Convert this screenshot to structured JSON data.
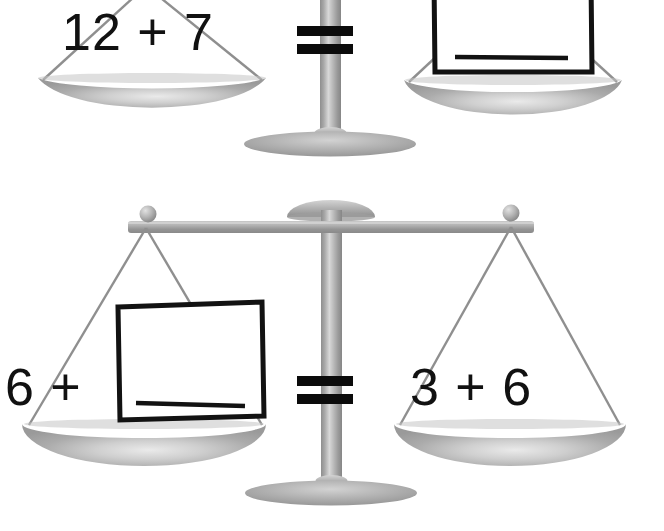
{
  "worksheet": {
    "type": "balance-scale-equations",
    "description": "Two balance scales each showing an addition equation with one side blank to fill in",
    "background_color": "#ffffff",
    "ink_color": "#111111",
    "metal_color": "#9a9a9a"
  },
  "scales": [
    {
      "id": "scale-top",
      "left_pan": {
        "label": "12 + 7",
        "contents": "expression",
        "value_a": 12,
        "operator": "+",
        "value_b": 7,
        "sum": 19
      },
      "right_pan": {
        "label": "",
        "contents": "answer-box",
        "has_answer_line": true,
        "answer_line_blank": true
      },
      "relation": "=",
      "relation_icon": "equals-icon"
    },
    {
      "id": "scale-bottom",
      "left_pan": {
        "label": "6 +",
        "contents": "expression-plus-answer-box",
        "value_a": 6,
        "operator": "+",
        "has_answer_line": true,
        "answer_line_blank": true
      },
      "right_pan": {
        "label": "3 + 6",
        "contents": "expression",
        "value_a": 3,
        "operator": "+",
        "value_b": 6,
        "sum": 9
      },
      "relation": "=",
      "relation_icon": "equals-icon"
    }
  ],
  "labels": {
    "top_left_expression": "12 + 7",
    "top_right_expression": "",
    "bottom_left_expression": "6 +",
    "bottom_right_expression": "3 + 6",
    "equals_top": "=",
    "equals_bottom": "="
  }
}
